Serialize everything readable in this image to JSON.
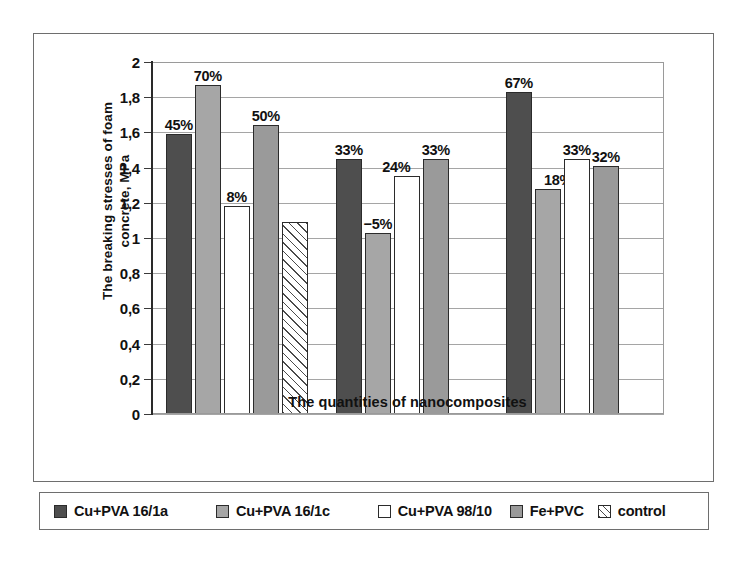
{
  "chart_data": {
    "type": "bar",
    "title": "",
    "xlabel": "The quantities of nanocomposites",
    "ylabel": "The breaking stresses of foam concrete, MPa",
    "ylabel_line1": "The breaking stresses of foam",
    "ylabel_line2": "concrete, MPa",
    "ylim": [
      0,
      2
    ],
    "ytick_step": 0.2,
    "ytick_labels": [
      "2",
      "1,8",
      "1,6",
      "1,4",
      "1,2",
      "1",
      "0,8",
      "0,6",
      "0,4",
      "0,2",
      "0"
    ],
    "ytick_values": [
      2,
      1.8,
      1.6,
      1.4,
      1.2,
      1,
      0.8,
      0.6,
      0.4,
      0.2,
      0
    ],
    "grid": true,
    "legend_position": "bottom",
    "categories": [
      "group-1",
      "group-2",
      "group-3"
    ],
    "series": [
      {
        "name": "Cu+PVA 16/1a",
        "key": "s0",
        "color": "#4e4e4e"
      },
      {
        "name": "Cu+PVA 16/1c",
        "key": "s1",
        "color": "#a6a6a6"
      },
      {
        "name": "Cu+PVA 98/10",
        "key": "s2",
        "color": "#ffffff"
      },
      {
        "name": "Fe+PVC",
        "key": "s3",
        "color": "#9a9a9a"
      },
      {
        "name": "control",
        "key": "s4",
        "color": "#ffffff"
      }
    ],
    "bars": [
      {
        "group": 0,
        "series": 0,
        "value": 1.59,
        "label": "45%",
        "label_offset": "center"
      },
      {
        "group": 0,
        "series": 1,
        "value": 1.87,
        "label": "70%",
        "label_offset": "center"
      },
      {
        "group": 0,
        "series": 2,
        "value": 1.18,
        "label": "8%",
        "label_offset": "center"
      },
      {
        "group": 0,
        "series": 3,
        "value": 1.64,
        "label": "50%",
        "label_offset": "center"
      },
      {
        "group": 0,
        "series": 4,
        "value": 1.09,
        "label": "",
        "label_offset": "center"
      },
      {
        "group": 1,
        "series": 0,
        "value": 1.45,
        "label": "33%",
        "label_offset": "center"
      },
      {
        "group": 1,
        "series": 1,
        "value": 1.03,
        "label": "−5%",
        "label_offset": "center"
      },
      {
        "group": 1,
        "series": 2,
        "value": 1.35,
        "label": "24%",
        "label_offset": "left"
      },
      {
        "group": 1,
        "series": 3,
        "value": 1.45,
        "label": "33%",
        "label_offset": "center"
      },
      {
        "group": 2,
        "series": 0,
        "value": 1.83,
        "label": "67%",
        "label_offset": "center"
      },
      {
        "group": 2,
        "series": 1,
        "value": 1.28,
        "label": "18%",
        "label_offset": "right"
      },
      {
        "group": 2,
        "series": 2,
        "value": 1.45,
        "label": "33%",
        "label_offset": "center"
      },
      {
        "group": 2,
        "series": 3,
        "value": 1.41,
        "label": "32%",
        "label_offset": "center"
      }
    ]
  },
  "legend": {
    "items": [
      {
        "label": "Cu+PVA 16/1a",
        "swatch": "s0"
      },
      {
        "label": "Cu+PVA 16/1c",
        "swatch": "s1"
      },
      {
        "label": "Cu+PVA 98/10",
        "swatch": "s2"
      },
      {
        "label": "Fe+PVC",
        "swatch": "s3"
      },
      {
        "label": "control",
        "swatch": "s4"
      }
    ]
  }
}
